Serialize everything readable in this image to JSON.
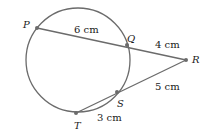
{
  "diagram": {
    "type": "circle-with-secants",
    "points": {
      "P": {
        "label": "P",
        "x": 37,
        "y": 28
      },
      "Q": {
        "label": "Q",
        "x": 127,
        "y": 45
      },
      "R": {
        "label": "R",
        "x": 186,
        "y": 60
      },
      "S": {
        "label": "S",
        "x": 117,
        "y": 92
      },
      "T": {
        "label": "T",
        "x": 76,
        "y": 113
      }
    },
    "circle": {
      "cx": 78,
      "cy": 60,
      "r": 52
    },
    "segments": [
      {
        "from": "P",
        "to": "Q",
        "label": "6 cm"
      },
      {
        "from": "Q",
        "to": "R",
        "label": "4 cm"
      },
      {
        "from": "R",
        "to": "S",
        "label": "5 cm"
      },
      {
        "from": "S",
        "to": "T",
        "label": "3 cm"
      }
    ],
    "colors": {
      "line": "#6b6b6b",
      "point": "#6b6b6b",
      "text": "#1a1a1a"
    }
  }
}
